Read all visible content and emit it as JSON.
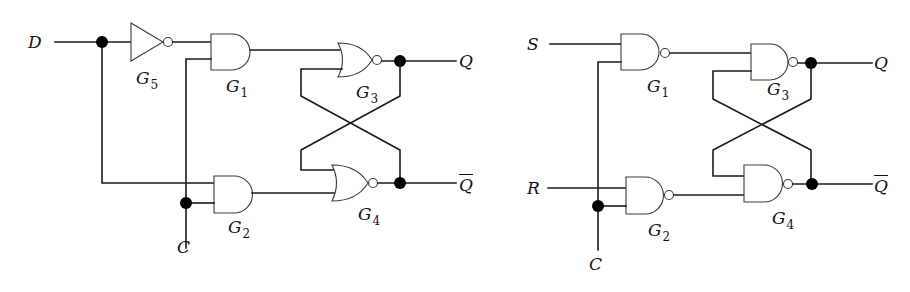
{
  "diagram": {
    "left_circuit": {
      "title": "D latch (NOR-based)",
      "inputs": {
        "d": "D",
        "c": "C"
      },
      "outputs": {
        "q": "Q",
        "q_bar": "Q"
      },
      "gates": {
        "g5": {
          "letter": "G",
          "index": "5",
          "type": "NOT"
        },
        "g1": {
          "letter": "G",
          "index": "1",
          "type": "AND"
        },
        "g2": {
          "letter": "G",
          "index": "2",
          "type": "AND"
        },
        "g3": {
          "letter": "G",
          "index": "3",
          "type": "NOR"
        },
        "g4": {
          "letter": "G",
          "index": "4",
          "type": "NOR"
        }
      }
    },
    "right_circuit": {
      "title": "Clocked SR latch (NAND-based)",
      "inputs": {
        "s": "S",
        "r": "R",
        "c": "C"
      },
      "outputs": {
        "q": "Q",
        "q_bar": "Q"
      },
      "gates": {
        "g1": {
          "letter": "G",
          "index": "1",
          "type": "NAND"
        },
        "g2": {
          "letter": "G",
          "index": "2",
          "type": "NAND"
        },
        "g3": {
          "letter": "G",
          "index": "3",
          "type": "NAND"
        },
        "g4": {
          "letter": "G",
          "index": "4",
          "type": "NAND"
        }
      }
    },
    "colors": {
      "line": "#1a1a1a",
      "background": "#ffffff",
      "junction": "#000000"
    }
  }
}
